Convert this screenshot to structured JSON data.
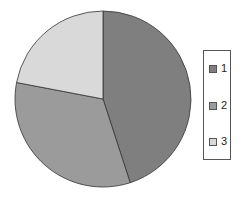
{
  "chart_data": {
    "type": "pie",
    "title": "",
    "categories": [
      "1",
      "2",
      "3"
    ],
    "values": [
      45,
      33,
      22
    ],
    "colors": [
      "#7f7f7f",
      "#9b9b9b",
      "#d9d9d9"
    ],
    "start_angle": "top, clockwise",
    "legend": {
      "position": "right",
      "entries": [
        "1",
        "2",
        "3"
      ]
    }
  }
}
